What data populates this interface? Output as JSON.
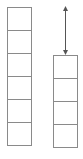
{
  "diagram": {
    "type": "stacked-unit-columns",
    "line_color": "#8a8a8a",
    "unit_size_px": 24,
    "left_column": {
      "units": 6
    },
    "right_column": {
      "units": 4
    },
    "arrow": {
      "kind": "double-headed",
      "spans_units": 2,
      "label": ""
    }
  }
}
